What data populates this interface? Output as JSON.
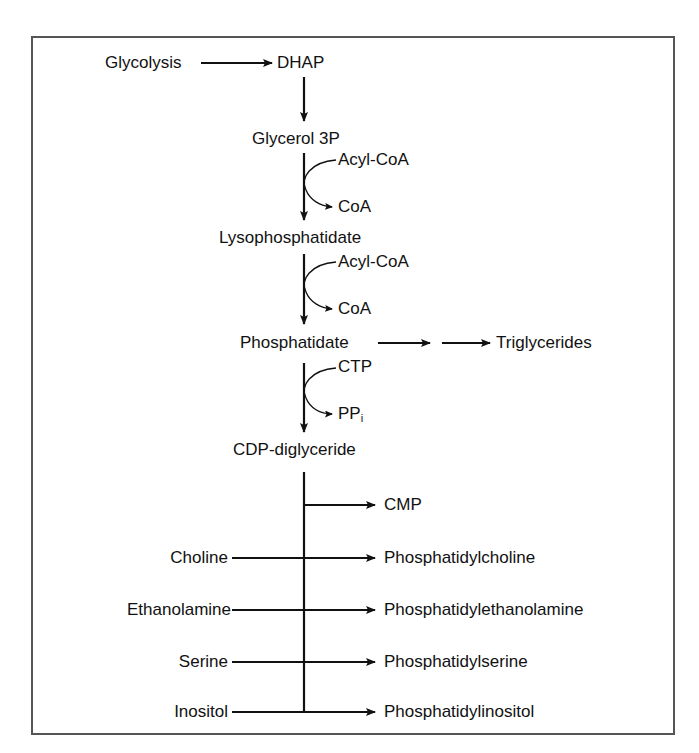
{
  "figure": {
    "nodes": {
      "glycolysis": "Glycolysis",
      "dhap": "DHAP",
      "glycerol3p": "Glycerol 3P",
      "lysophosphatidate": "Lysophosphatidate",
      "phosphatidate": "Phosphatidate",
      "triglycerides": "Triglycerides",
      "cdp_diglyceride": "CDP-diglyceride",
      "cmp": "CMP"
    },
    "side_reactions": [
      {
        "in": "Acyl-CoA",
        "out": "CoA"
      },
      {
        "in": "Acyl-CoA",
        "out": "CoA"
      },
      {
        "in": "CTP",
        "out": "PP",
        "out_sub": "i"
      }
    ],
    "head_groups": [
      {
        "substrate": "Choline",
        "product": "Phosphatidylcholine"
      },
      {
        "substrate": "Ethanolamine",
        "product": "Phosphatidylethanolamine"
      },
      {
        "substrate": "Serine",
        "product": "Phosphatidylserine"
      },
      {
        "substrate": "Inositol",
        "product": "Phosphatidylinositol"
      }
    ],
    "colors": {
      "line": "#111111",
      "frame": "#555555",
      "background": "#ffffff"
    }
  }
}
